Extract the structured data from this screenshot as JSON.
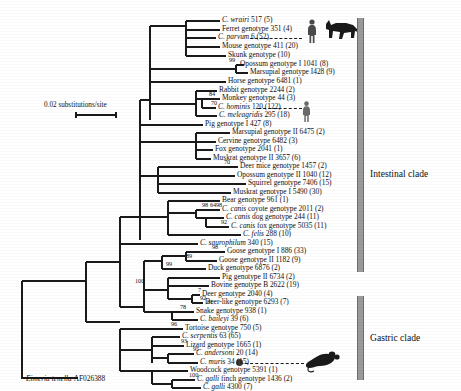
{
  "figure": {
    "scale_bar_label": "0.02 substitutions/site",
    "outgroup": {
      "name": "Eimeria tenella",
      "accession": "AF026388"
    },
    "clades": [
      {
        "id": "intestinal",
        "label": "Intestinal clade"
      },
      {
        "id": "gastric",
        "label": "Gastric clade"
      }
    ],
    "silhouettes": [
      {
        "name": "human-silhouette",
        "tip": "C. hominis 120 (122)"
      },
      {
        "name": "human-silhouette-top",
        "tip": "C. parvum 6 (52)"
      },
      {
        "name": "cow-silhouette",
        "tip": "C. parvum 6 (52)"
      },
      {
        "name": "mouse-silhouette",
        "tip": "C. muris 34 (15)"
      }
    ]
  },
  "taxa": [
    {
      "id": "t1",
      "italic": "C. wrairi",
      "rest": " 517 (5)",
      "y": 21,
      "x": 222
    },
    {
      "id": "t2",
      "italic": "",
      "rest": "Ferret genotype 351 (4)",
      "y": 30,
      "x": 222
    },
    {
      "id": "t3",
      "italic": "C. parvum",
      "rest": " 6 (52)",
      "y": 38,
      "x": 218
    },
    {
      "id": "t4",
      "italic": "",
      "rest": "Mouse genotype 411 (20)",
      "y": 47,
      "x": 222
    },
    {
      "id": "t5",
      "italic": "",
      "rest": "Skunk genotype (10)",
      "y": 56,
      "x": 228
    },
    {
      "id": "t6",
      "italic": "",
      "rest": "Opossum genotype I 1041 (8)",
      "y": 65,
      "x": 240
    },
    {
      "id": "t7",
      "italic": "",
      "rest": "Marsupial genotype I428 (9)",
      "y": 73,
      "x": 250
    },
    {
      "id": "t8",
      "italic": "",
      "rest": "Horse genotype 6481 (1)",
      "y": 82,
      "x": 228
    },
    {
      "id": "t9",
      "italic": "",
      "rest": "Rabbit genotype 2244 (2)",
      "y": 91,
      "x": 219
    },
    {
      "id": "t10",
      "italic": "",
      "rest": "Monkey genotype 44 (3)",
      "y": 99,
      "x": 222
    },
    {
      "id": "t11",
      "italic": "C. hominis",
      "rest": " 120 (122)",
      "y": 108,
      "x": 218
    },
    {
      "id": "t12",
      "italic": "C. meleagridis",
      "rest": " 295 (18)",
      "y": 116,
      "x": 219
    },
    {
      "id": "t13",
      "italic": "",
      "rest": "Pig genotype I 427 (8)",
      "y": 125,
      "x": 205
    },
    {
      "id": "t14",
      "italic": "",
      "rest": "Marsupial genotype II 6475 (2)",
      "y": 133,
      "x": 232
    },
    {
      "id": "t15",
      "italic": "",
      "rest": "Cervine genotype 6482 (3)",
      "y": 142,
      "x": 218
    },
    {
      "id": "t16",
      "italic": "",
      "rest": "Fox genotype 2041 (1)",
      "y": 150,
      "x": 215
    },
    {
      "id": "t17",
      "italic": "",
      "rest": "Muskrat genotype II 3657 (6)",
      "y": 159,
      "x": 213
    },
    {
      "id": "t18",
      "italic": "",
      "rest": "Deer mice genotype 1457 (2)",
      "y": 167,
      "x": 240
    },
    {
      "id": "t19",
      "italic": "",
      "rest": "Opossum genotype II 1040 (12)",
      "y": 176,
      "x": 237
    },
    {
      "id": "t20",
      "italic": "",
      "rest": "Squirrel genotype 7406 (15)",
      "y": 184,
      "x": 248
    },
    {
      "id": "t21",
      "italic": "",
      "rest": "Muskrat genotype I 5490 (30)",
      "y": 193,
      "x": 233
    },
    {
      "id": "t22",
      "italic": "",
      "rest": "Bear genotype 961 (1)",
      "y": 201,
      "x": 222
    },
    {
      "id": "t23",
      "italic": "C. canis",
      "rest": " coyote genotype 2011 (2)",
      "y": 210,
      "x": 222
    },
    {
      "id": "t24",
      "italic": "C. canis",
      "rest": " dog genotype 244 (11)",
      "y": 218,
      "x": 226
    },
    {
      "id": "t25",
      "italic": "C. canis",
      "rest": " fox genotype 5035 (11)",
      "y": 227,
      "x": 231
    },
    {
      "id": "t26",
      "italic": "C. felis",
      "rest": " 288 (10)",
      "y": 235,
      "x": 243
    },
    {
      "id": "t27",
      "italic": "C. saurophilum",
      "rest": " 340 (15)",
      "y": 244,
      "x": 200
    },
    {
      "id": "t28",
      "italic": "",
      "rest": "Goose genotype I 886 (33)",
      "y": 252,
      "x": 227
    },
    {
      "id": "t29",
      "italic": "",
      "rest": "Goose genotype II 1182 (9)",
      "y": 261,
      "x": 219
    },
    {
      "id": "t30",
      "italic": "",
      "rest": "Duck genotype 6876 (2)",
      "y": 269,
      "x": 208
    },
    {
      "id": "t31",
      "italic": "",
      "rest": "Pig genotype II 6734 (2)",
      "y": 278,
      "x": 222
    },
    {
      "id": "t32",
      "italic": "",
      "rest": "Bovine genotype B 2622 (19)",
      "y": 286,
      "x": 211
    },
    {
      "id": "t33",
      "italic": "",
      "rest": "Deer genotype 2040 (4)",
      "y": 295,
      "x": 202
    },
    {
      "id": "t34",
      "italic": "",
      "rest": "Deer-like genotype 6293 (7)",
      "y": 303,
      "x": 205
    },
    {
      "id": "t35",
      "italic": "",
      "rest": "Snake genotype 938 (1)",
      "y": 312,
      "x": 196
    },
    {
      "id": "t36",
      "italic": "C. baileyi",
      "rest": " 39 (6)",
      "y": 320,
      "x": 200
    },
    {
      "id": "t37",
      "italic": "",
      "rest": "Tortoise genotype 750 (5)",
      "y": 329,
      "x": 185
    },
    {
      "id": "t38",
      "italic": "C. serpentis",
      "rest": " 63 (65)",
      "y": 337,
      "x": 182
    },
    {
      "id": "t39",
      "italic": "",
      "rest": "Lizard genotype 1665 (1)",
      "y": 346,
      "x": 186
    },
    {
      "id": "t40",
      "italic": "C. andersoni",
      "rest": " 20 (14)",
      "y": 354,
      "x": 196
    },
    {
      "id": "t41",
      "italic": "C. muris",
      "rest": " 34 (15)",
      "y": 363,
      "x": 200
    },
    {
      "id": "t42",
      "italic": "",
      "rest": "Woodcock genotype 5391 (1)",
      "y": 371,
      "x": 190
    },
    {
      "id": "t43",
      "italic": "C. galli",
      "rest": " finch genotype 1436 (2)",
      "y": 380,
      "x": 197
    },
    {
      "id": "t44",
      "italic": "C. galli",
      "rest": " 4300 (7)",
      "y": 388,
      "x": 203
    }
  ],
  "bootstraps": [
    {
      "value": "99",
      "x": 229,
      "y": 60
    },
    {
      "value": "84",
      "x": 209,
      "y": 94
    },
    {
      "value": "70",
      "x": 211,
      "y": 103
    },
    {
      "value": "70",
      "x": 224,
      "y": 162
    },
    {
      "value": "98",
      "x": 202,
      "y": 205
    },
    {
      "value": "64",
      "x": 210,
      "y": 205
    },
    {
      "value": "98",
      "x": 216,
      "y": 205
    },
    {
      "value": "92",
      "x": 221,
      "y": 222
    },
    {
      "value": "98",
      "x": 212,
      "y": 247
    },
    {
      "value": "89",
      "x": 186,
      "y": 256
    },
    {
      "value": "99",
      "x": 166,
      "y": 264
    },
    {
      "value": "7",
      "x": 198,
      "y": 290
    },
    {
      "value": "92",
      "x": 200,
      "y": 298
    },
    {
      "value": "81",
      "x": 207,
      "y": 302
    },
    {
      "value": "78",
      "x": 180,
      "y": 307
    },
    {
      "value": "100",
      "x": 135,
      "y": 281
    },
    {
      "value": "96",
      "x": 171,
      "y": 324
    },
    {
      "value": "93",
      "x": 181,
      "y": 341
    },
    {
      "value": "95",
      "x": 193,
      "y": 349
    },
    {
      "value": "100",
      "x": 189,
      "y": 375
    }
  ],
  "chart_data": {
    "type": "tree",
    "scale": "0.02 substitutions/site",
    "root_outgroup": "Eimeria tenella AF026388",
    "clades": [
      "Intestinal clade",
      "Gastric clade"
    ],
    "n_taxa": 44
  }
}
